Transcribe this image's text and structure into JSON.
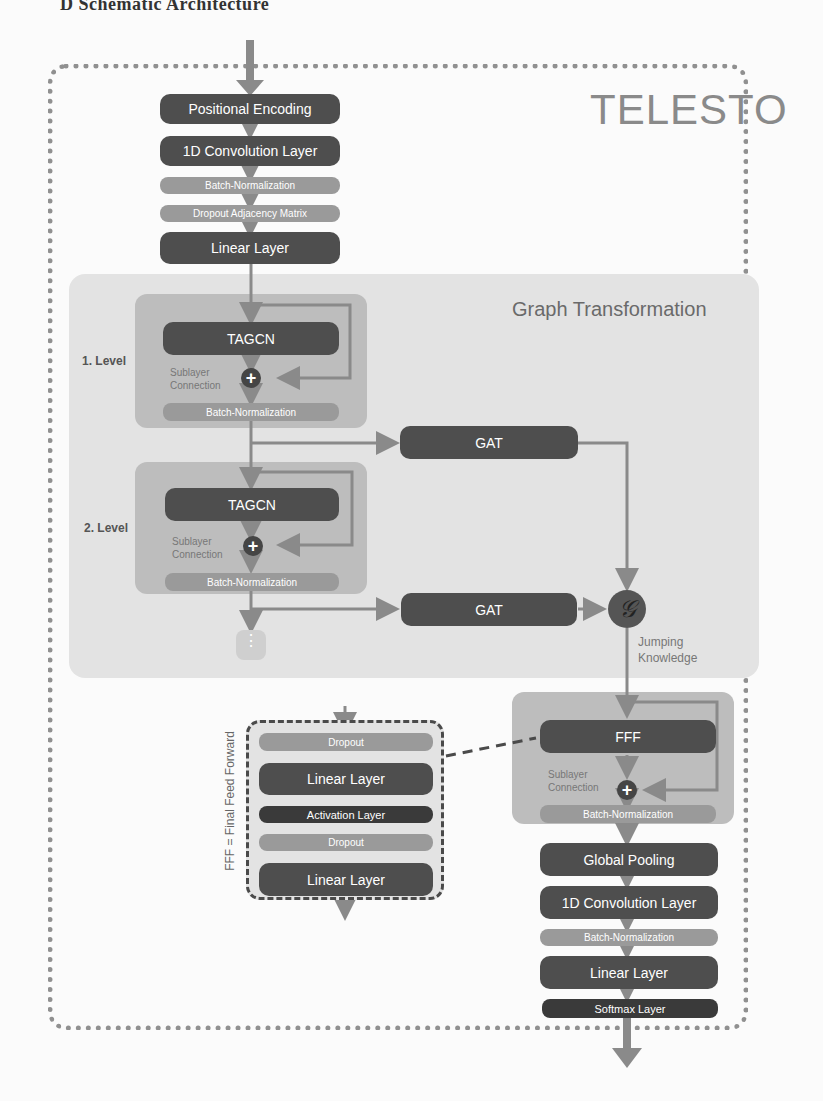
{
  "caption": "D Schematic Architecture",
  "title": "TELESTO",
  "input_stack": [
    {
      "label": "Positional Encoding",
      "style": "dark"
    },
    {
      "label": "1D Convolution Layer",
      "style": "dark"
    },
    {
      "label": "Batch-Normalization",
      "style": "mid"
    },
    {
      "label": "Dropout Adjacency Matrix",
      "style": "mid"
    },
    {
      "label": "Linear Layer",
      "style": "dark"
    }
  ],
  "graph_transformation": {
    "title": "Graph Transformation",
    "levels": [
      {
        "label": "1. Level",
        "block": "TAGCN",
        "sublayer": "Sublayer Connection",
        "norm": "Batch-Normalization",
        "side": "GAT"
      },
      {
        "label": "2. Level",
        "block": "TAGCN",
        "sublayer": "Sublayer Connection",
        "norm": "Batch-Normalization",
        "side": "GAT"
      }
    ],
    "ellipsis": "⋮",
    "aggregator": {
      "symbol": "𝒢",
      "label_line1": "Jumping",
      "label_line2": "Knowledge"
    }
  },
  "fff_block": {
    "block": "FFF",
    "sublayer_line1": "Sublayer",
    "sublayer_line2": "Connection",
    "norm": "Batch-Normalization",
    "legend": "FFF = Final Feed Forward",
    "detail": [
      {
        "label": "Dropout",
        "style": "mid"
      },
      {
        "label": "Linear Layer",
        "style": "dark"
      },
      {
        "label": "Activation Layer",
        "style": "darker"
      },
      {
        "label": "Dropout",
        "style": "mid"
      },
      {
        "label": "Linear Layer",
        "style": "dark"
      }
    ]
  },
  "output_stack": [
    {
      "label": "Global Pooling",
      "style": "dark"
    },
    {
      "label": "1D Convolution Layer",
      "style": "dark"
    },
    {
      "label": "Batch-Normalization",
      "style": "mid"
    },
    {
      "label": "Linear Layer",
      "style": "dark"
    },
    {
      "label": "Softmax Layer",
      "style": "darker"
    }
  ],
  "colors": {
    "dark": "#4e4e4e",
    "mid": "#9a9a9a",
    "darker": "#3a3a3a",
    "arrow": "#8a8a8a"
  }
}
